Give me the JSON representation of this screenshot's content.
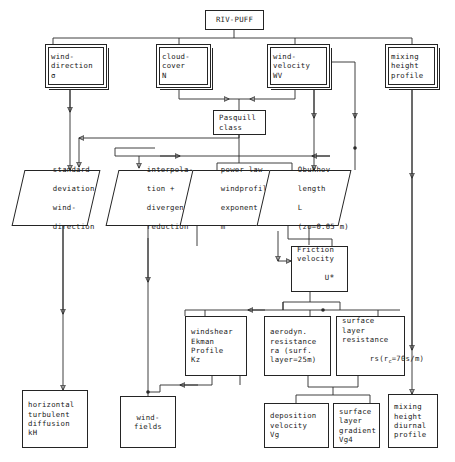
{
  "diagram": {
    "root": "RIV-PUFF",
    "colors": {
      "line": "#2a2a2a",
      "box": "#242424",
      "background": "#ffffff"
    }
  },
  "nodes": {
    "riv_puff": {
      "label": "RIV-PUFF",
      "shape": "box"
    },
    "wind_direction": {
      "l1": "wind-",
      "l2": "direction",
      "l3": "σ",
      "shape": "box-double"
    },
    "cloud_cover": {
      "l1": "cloud-",
      "l2": "cover",
      "l3": "N",
      "shape": "box-double"
    },
    "wind_velocity": {
      "l1": "wind-",
      "l2": "velocity",
      "l3": "WV",
      "shape": "box-double"
    },
    "mixing_height_profile": {
      "l1": "mixing",
      "l2": "height",
      "l3": "profile",
      "shape": "box-double"
    },
    "pasquill": {
      "l1": "Pasquill",
      "l2": "class",
      "shape": "box"
    },
    "std_dev_wind_dir": {
      "l1": "standard",
      "l2": "deviation",
      "l3": "wind-",
      "l4": "direction",
      "shape": "parallelogram"
    },
    "interpolation": {
      "l1": "interpola-",
      "l2": "tion +",
      "l3": "divergence",
      "l4": "reduction",
      "shape": "parallelogram"
    },
    "power_law": {
      "l1": "power law",
      "l2": "windprofile",
      "l3": "exponent",
      "l4": "m",
      "shape": "parallelogram"
    },
    "obukhov": {
      "l1": "Obukhov",
      "l2": "length",
      "l3": "L",
      "l4": "(zo=0.05 m)",
      "shape": "parallelogram"
    },
    "friction_velocity": {
      "l1": "Friction",
      "l2": "velocity",
      "l3": "U",
      "l3sub": "*",
      "shape": "box"
    },
    "windshear": {
      "l1": "windshear",
      "l2": "Ekman",
      "l3": "Profile",
      "l4": "Kz",
      "shape": "box"
    },
    "aerodyn_resistance": {
      "l1": "aerodyn.",
      "l2": "resistance",
      "l3": "ra (surf.",
      "l4": "layer=25m)",
      "shape": "box"
    },
    "surface_layer_resistance": {
      "l1": "surface",
      "l2": "layer",
      "l3": "resistance",
      "l4pre": "rs(r",
      "l4sub": "c",
      "l4post": "=70s/m)",
      "shape": "box"
    },
    "horizontal_diffusion": {
      "l1": "horizontal",
      "l2": "turbulent",
      "l3": "diffusion",
      "l4": "kH",
      "shape": "box"
    },
    "windfields": {
      "l1": "wind-",
      "l2": "fields",
      "shape": "box"
    },
    "deposition_velocity": {
      "l1": "deposition",
      "l2": "velocity",
      "l3": "Vg",
      "shape": "box"
    },
    "surface_layer_gradient": {
      "l1": "surface",
      "l2": "layer",
      "l3": "gradient",
      "l4": "Vg4",
      "shape": "box"
    },
    "mixing_height_diurnal": {
      "l1": "mixing",
      "l2": "height",
      "l3": "diurnal",
      "l4": "profile",
      "shape": "box"
    }
  }
}
